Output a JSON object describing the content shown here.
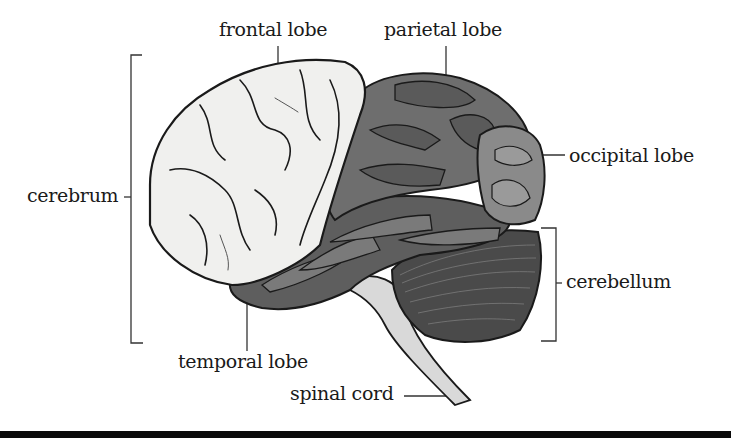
{
  "diagram": {
    "labels": {
      "frontal": "frontal lobe",
      "parietal": "parietal lobe",
      "occipital": "occipital lobe",
      "cerebrum": "cerebrum",
      "cerebellum": "cerebellum",
      "temporal": "temporal lobe",
      "spinal": "spinal cord"
    },
    "colors": {
      "frontal": "#f0f0ee",
      "parietal": "#6e6e6e",
      "occipital": "#8a8a8a",
      "temporal": "#5e5e5e",
      "cerebellum": "#4a4a4a",
      "spinal": "#d8d8d8",
      "outline": "#1a1a1a",
      "bottom_bar": "#0a0a0a"
    }
  }
}
